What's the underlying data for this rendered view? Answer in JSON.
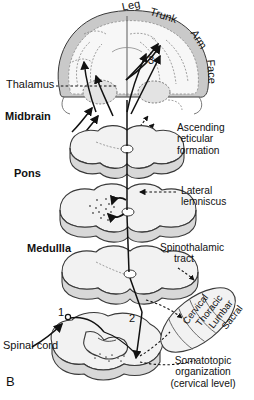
{
  "figure": {
    "panel_label": "B",
    "description_type": "diagram"
  },
  "cortex_labels": [
    {
      "text": "Leg",
      "rotation": -12
    },
    {
      "text": "Trunk",
      "rotation": 18
    },
    {
      "text": "Arm",
      "rotation": 58
    },
    {
      "text": "Face",
      "rotation": 86
    }
  ],
  "structure_labels": [
    {
      "text": "Thalamus",
      "style": "plain"
    },
    {
      "text": "Midbrain",
      "style": "bold"
    },
    {
      "text": "Pons",
      "style": "bold"
    },
    {
      "text": "Medullla",
      "style": "bold"
    },
    {
      "text": "Spinal cord",
      "style": "plain"
    }
  ],
  "callouts": [
    {
      "id": "ascending-reticular-formation",
      "lines": [
        "Ascending",
        "reticular",
        "formation"
      ]
    },
    {
      "id": "lateral-lemniscus",
      "lines": [
        "Lateral",
        "lemniscus"
      ]
    },
    {
      "id": "spinothalamic-tract",
      "lines": [
        "Spinothalamic",
        "tract"
      ]
    },
    {
      "id": "somatotopic-organization",
      "lines": [
        "Somatotopic",
        "organization",
        "(cervical level)"
      ]
    }
  ],
  "somatotopic_bands": [
    {
      "text": "Cervical"
    },
    {
      "text": "Thoracic"
    },
    {
      "text": "Lumbar"
    },
    {
      "text": "Sacral"
    }
  ],
  "neuron_order_markers": [
    {
      "text": "1"
    },
    {
      "text": "2"
    },
    {
      "text": "3"
    }
  ],
  "colors": {
    "ink": "#111111",
    "outline": "#3a3a3a",
    "cortex_gray": "#c9c9c9",
    "tissue_fill": "#f2f2f2",
    "tissue_shade": "#d8d8d8",
    "background": "#ffffff"
  }
}
